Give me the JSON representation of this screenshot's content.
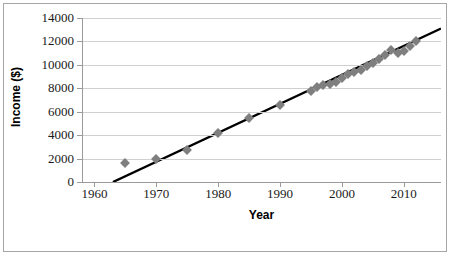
{
  "chart_data": {
    "type": "scatter",
    "title": "",
    "xlabel": "Year",
    "ylabel": "Income ($)",
    "xlim": [
      1958,
      2016
    ],
    "ylim": [
      0,
      14000
    ],
    "grid": true,
    "legend": "none",
    "marker_color": "#7f7f7f",
    "marker_shape": "diamond",
    "trendline_color": "#000000",
    "xticks": [
      "1960",
      "1970",
      "1980",
      "1990",
      "2000",
      "2010"
    ],
    "xtick_values": [
      1960,
      1970,
      1980,
      1990,
      2000,
      2010
    ],
    "yticks": [
      "0",
      "2000",
      "4000",
      "6000",
      "8000",
      "10000",
      "12000",
      "14000"
    ],
    "ytick_values": [
      0,
      2000,
      4000,
      6000,
      8000,
      10000,
      12000,
      14000
    ],
    "series": [
      {
        "name": "Income",
        "x": [
          1965,
          1970,
          1975,
          1980,
          1985,
          1990,
          1995,
          1996,
          1997,
          1998,
          1999,
          2000,
          2001,
          2002,
          2003,
          2004,
          2005,
          2006,
          2007,
          2008,
          2009,
          2010,
          2011,
          2012
        ],
        "y": [
          1600,
          1950,
          2700,
          4200,
          5450,
          6600,
          7800,
          8100,
          8300,
          8400,
          8500,
          8900,
          9200,
          9400,
          9600,
          9900,
          10200,
          10500,
          10800,
          11250,
          11000,
          11150,
          11600,
          12000
        ]
      }
    ],
    "trendline": {
      "type": "linear",
      "x_start": 1963,
      "y_start": 0,
      "x_end": 2016,
      "y_end": 13100
    }
  },
  "axes": {
    "y_title": "Income ($)",
    "x_title": "Year"
  }
}
